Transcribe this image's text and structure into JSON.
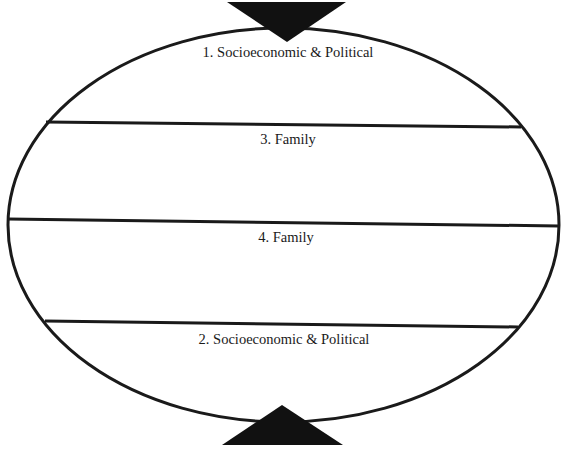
{
  "diagram": {
    "type": "oval divided into four horizontal bands with opposing arrows",
    "colors": {
      "stroke": "#1a1a1a",
      "fill": "#111111",
      "background": "#ffffff"
    },
    "bands": [
      {
        "order": 1,
        "label": "1. Socioeconomic & Political",
        "position": "top"
      },
      {
        "order": 2,
        "label": "3. Family",
        "position": "upper-middle"
      },
      {
        "order": 3,
        "label": "4. Family",
        "position": "lower-middle"
      },
      {
        "order": 4,
        "label": "2. Socioeconomic & Political",
        "position": "bottom"
      }
    ],
    "arrows": [
      {
        "name": "top-arrow",
        "direction": "down"
      },
      {
        "name": "bottom-arrow",
        "direction": "up"
      }
    ]
  }
}
